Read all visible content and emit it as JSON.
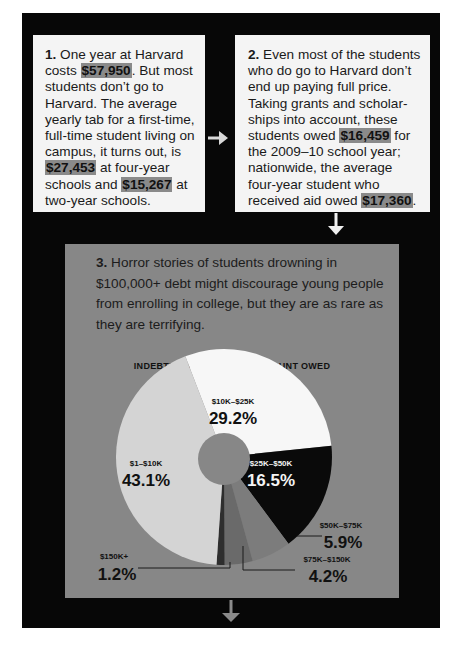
{
  "steps": [
    {
      "number": "1.",
      "segments": [
        {
          "text": " One year at Harvard costs ",
          "highlight": false
        },
        {
          "text": "$57,950",
          "highlight": true
        },
        {
          "text": ". But most students don’t go to Harvard. The average yearly tab for a first-time, full-time student living on campus, it turns out, is ",
          "highlight": false
        },
        {
          "text": "$27,453",
          "highlight": true
        },
        {
          "text": " at four-year schools and ",
          "highlight": false
        },
        {
          "text": "$15,267",
          "highlight": true
        },
        {
          "text": " at two-year schools.",
          "highlight": false
        }
      ]
    },
    {
      "number": "2.",
      "segments": [
        {
          "text": " Even most of the students who do go to Harvard don’t end up paying full price. Taking grants and scholar-ships into account, these students owed ",
          "highlight": false
        },
        {
          "text": "$16,459",
          "highlight": true
        },
        {
          "text": " for the 2009–10 school year; nationwide, the average four-year student who received aid owed ",
          "highlight": false
        },
        {
          "text": "$17,360",
          "highlight": true
        },
        {
          "text": ".",
          "highlight": false
        }
      ]
    },
    {
      "number": "3.",
      "text": " Horror stories of students drowning in $100,000+ debt might discourage young people from enrolling in college, but they are as rare as they are terrifying."
    }
  ],
  "colors": {
    "background": "#ffffff",
    "panel": "#070707",
    "box_light": "#f4f4f4",
    "box_gray": "#878787",
    "highlight": "#8a8a8a",
    "arrow": "#d8d8d8",
    "arrow_bottom": "#8a8a8a"
  },
  "chart_data": {
    "type": "pie",
    "title": "INDEBTED STUDENTS, BY AMOUNT OWED",
    "categories": [
      "$1–$10K",
      "$10K–$25K",
      "$25K–$50K",
      "$50K–$75K",
      "$75K–$150K",
      "$150K+"
    ],
    "values": [
      43.1,
      29.2,
      16.5,
      5.9,
      4.2,
      1.2
    ],
    "value_labels": [
      "43.1%",
      "29.2%",
      "16.5%",
      "5.9%",
      "4.2%",
      "1.2%"
    ],
    "slice_colors": [
      "#d4d4d4",
      "#f7f7f7",
      "#0a0a0a",
      "#7c7c7c",
      "#6a6a6a",
      "#2e2e2e"
    ],
    "donut_hole": true,
    "legend": "none (direct labels)",
    "unit": "percent"
  }
}
